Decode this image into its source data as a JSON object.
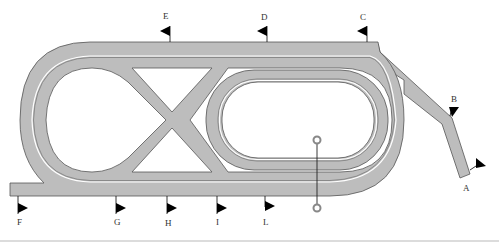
{
  "diagram": {
    "colors": {
      "track": "#bdbdbd",
      "outline": "#555555",
      "flag": "#000000",
      "background": "#ffffff"
    },
    "markers": [
      {
        "id": "A",
        "label": "A"
      },
      {
        "id": "B",
        "label": "B"
      },
      {
        "id": "C",
        "label": "C"
      },
      {
        "id": "D",
        "label": "D"
      },
      {
        "id": "E",
        "label": "E"
      },
      {
        "id": "F",
        "label": "F"
      },
      {
        "id": "G",
        "label": "G"
      },
      {
        "id": "H",
        "label": "H"
      },
      {
        "id": "I",
        "label": "I"
      },
      {
        "id": "L",
        "label": "L"
      }
    ],
    "elements": {
      "outer_course": "outer track with left loop",
      "figure_eight_crossing": "X crossover",
      "inner_oval": "inner oval track",
      "chute": "diagonal chute C to A",
      "finish_post": "winning post"
    }
  }
}
